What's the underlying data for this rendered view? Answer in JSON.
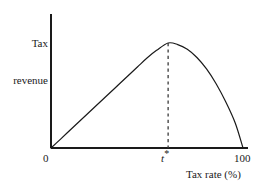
{
  "figure": {
    "background_color": "#ffffff",
    "line_color": "#1a1a1a",
    "dashed_line_color": "#3a3a3a"
  },
  "axes": {
    "ylabel_line1": "Tax",
    "ylabel_line2": "revenue",
    "xlabel": "Tax rate (%)",
    "origin_tick": "0",
    "max_tick": "100",
    "optimal_tick_symbol": "t",
    "optimal_tick_star": "*"
  },
  "chart_data": {
    "type": "line",
    "title": "",
    "xlabel": "Tax rate (%)",
    "ylabel": "Tax revenue",
    "xlim": [
      0,
      100
    ],
    "ylim": [
      0,
      1.05
    ],
    "grid": false,
    "legend": null,
    "xticks": [
      "0",
      "t*",
      "100"
    ],
    "xtick_values": [
      0,
      61,
      100
    ],
    "yticks": [],
    "annotations": [
      {
        "name": "optimal-rate-dashed-line",
        "type": "vertical-dashed-line",
        "x": 61,
        "y_from": 0,
        "y_to": 1.0,
        "label": "t*"
      }
    ],
    "series": [
      {
        "name": "Laffer curve",
        "x": [
          0,
          5,
          10,
          15,
          20,
          25,
          30,
          35,
          40,
          45,
          50,
          55,
          61,
          66,
          71,
          76,
          81,
          86,
          91,
          96,
          100
        ],
        "y": [
          0.0,
          0.085,
          0.171,
          0.257,
          0.343,
          0.428,
          0.514,
          0.6,
          0.686,
          0.771,
          0.857,
          0.93,
          1.0,
          0.985,
          0.94,
          0.862,
          0.753,
          0.612,
          0.44,
          0.236,
          0.0
        ]
      }
    ]
  }
}
